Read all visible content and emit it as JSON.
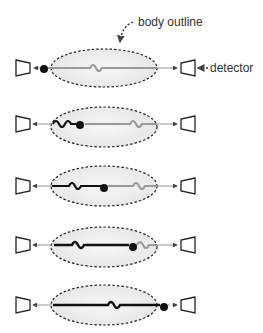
{
  "labels": {
    "body_outline": "body outline",
    "detector": "detector"
  },
  "colors": {
    "wavy_gray": "#9a9a9a",
    "wavy_black": "#111111",
    "axis": "#777777",
    "ellipse_fill": "#f0f0f0",
    "ellipse_stroke": "#222222"
  },
  "rows": [
    {
      "y": 68,
      "source_x": 44
    },
    {
      "y": 127,
      "source_x": 79
    },
    {
      "y": 188,
      "source_x": 104
    },
    {
      "y": 248,
      "source_x": 133
    },
    {
      "y": 306,
      "source_x": 164
    }
  ]
}
